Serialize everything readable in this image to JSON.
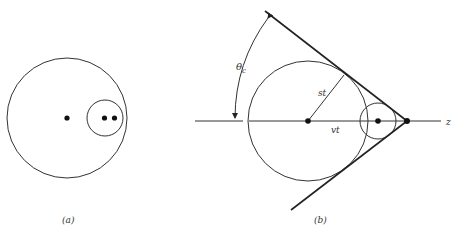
{
  "figure": {
    "panel_a": {
      "label": "(a)"
    },
    "panel_b": {
      "label": "(b)",
      "angle_label": "θ",
      "angle_subscript": "c",
      "radius_label": "st",
      "distance_label": "vt",
      "axis_label": "z"
    }
  },
  "colors": {
    "stroke": "#222222",
    "background": "#ffffff"
  }
}
